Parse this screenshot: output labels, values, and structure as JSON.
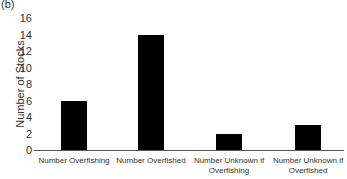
{
  "chart_data": {
    "type": "bar",
    "panel_label": "(b)",
    "title": "",
    "xlabel": "",
    "ylabel": "Number of Stocks",
    "categories": [
      "Number Overfishing",
      "Number Overfished",
      "Number Unknown if Overfishing",
      "Number Unknown if Overfished"
    ],
    "category_lines": [
      [
        "Number Overfishing"
      ],
      [
        "Number Overfished"
      ],
      [
        "Number Unknown if",
        "Overfishing"
      ],
      [
        "Number Unknown if",
        "Overfished"
      ]
    ],
    "values": [
      6,
      14,
      2,
      3
    ],
    "ylim": [
      0,
      16
    ],
    "yticks": [
      "0",
      "2",
      "4",
      "6",
      "8",
      "10",
      "12",
      "14",
      "16"
    ],
    "grid": false,
    "bar_color": "#000000"
  }
}
